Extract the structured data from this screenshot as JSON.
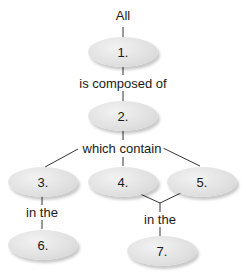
{
  "diagram": {
    "type": "concept-map",
    "root_label": "All",
    "nodes": [
      {
        "id": "1",
        "label": "1."
      },
      {
        "id": "2",
        "label": "2."
      },
      {
        "id": "3",
        "label": "3."
      },
      {
        "id": "4",
        "label": "4."
      },
      {
        "id": "5",
        "label": "5."
      },
      {
        "id": "6",
        "label": "6."
      },
      {
        "id": "7",
        "label": "7."
      }
    ],
    "links": [
      {
        "label": "is composed of"
      },
      {
        "label": "which contain"
      },
      {
        "label": "in the"
      },
      {
        "label": "in the"
      }
    ]
  }
}
